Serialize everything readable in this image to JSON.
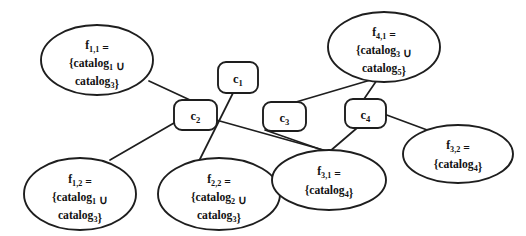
{
  "diagram": {
    "background_color": "#ffffff",
    "stroke_color": "#1e1e1e",
    "union_symbol": "∪",
    "fragments": [
      {
        "id": "f-1-1",
        "name": "f",
        "sub": "1,1",
        "line1": "f",
        "line1_sub": "1,1",
        "line1_eq": " =",
        "line2_open": "{catalog",
        "line2_sub": "1",
        "line2_tail": " ∪",
        "line3_open": "catalog",
        "line3_sub": "3",
        "line3_tail": "}",
        "full_text": "f1,1 = {catalog1 ∪ catalog3}",
        "cx": 97,
        "cy": 60,
        "rx": 56,
        "ry": 35
      },
      {
        "id": "f-4-1",
        "name": "f",
        "sub": "4,1",
        "line1": "f",
        "line1_sub": "4,1",
        "line1_eq": " =",
        "line2_open": "{catalog",
        "line2_sub": "3",
        "line2_tail": " ∪",
        "line3_open": "catalog",
        "line3_sub": "5",
        "line3_tail": "}",
        "full_text": "f4,1 = {catalog3 ∪ catalog5}",
        "cx": 384,
        "cy": 47,
        "rx": 56,
        "ry": 35
      },
      {
        "id": "f-1-2",
        "name": "f",
        "sub": "1,2",
        "line1": "f",
        "line1_sub": "1,2",
        "line1_eq": " =",
        "line2_open": "{catalog",
        "line2_sub": "1",
        "line2_tail": " ∪",
        "line3_open": "catalog",
        "line3_sub": "3",
        "line3_tail": "}",
        "full_text": "f1,2 = {catalog1 ∪ catalog3}",
        "cx": 80,
        "cy": 194,
        "rx": 56,
        "ry": 36
      },
      {
        "id": "f-2-2",
        "name": "f",
        "sub": "2,2",
        "line1": "f",
        "line1_sub": "2,2",
        "line1_eq": " =",
        "line2_open": "{catalog",
        "line2_sub": "2",
        "line2_tail": " ∪",
        "line3_open": "catalog",
        "line3_sub": "3",
        "line3_tail": "}",
        "full_text": "f2,2 = {catalog2 ∪ catalog3}",
        "cx": 219,
        "cy": 194,
        "rx": 61,
        "ry": 36
      },
      {
        "id": "f-3-1",
        "name": "f",
        "sub": "3,1",
        "line1": "f",
        "line1_sub": "3,1",
        "line1_eq": " =",
        "line2_open": "{catalog",
        "line2_sub": "4",
        "line2_tail": "}",
        "line3_open": "",
        "line3_sub": "",
        "line3_tail": "",
        "full_text": "f3,1 = {catalog4}",
        "cx": 329,
        "cy": 180,
        "rx": 57,
        "ry": 30
      },
      {
        "id": "f-3-2",
        "name": "f",
        "sub": "3,2",
        "line1": "f",
        "line1_sub": "3,2",
        "line1_eq": " =",
        "line2_open": "{catalog",
        "line2_sub": "4",
        "line2_tail": "}",
        "line3_open": "",
        "line3_sub": "",
        "line3_tail": "",
        "full_text": "f3,2 = {catalog4}",
        "cx": 458,
        "cy": 154,
        "rx": 55,
        "ry": 29
      }
    ],
    "sites": [
      {
        "id": "c-1",
        "name": "c",
        "sub": "1",
        "full_text": "c1",
        "x": 218,
        "y": 62,
        "w": 40,
        "h": 31,
        "r": 8
      },
      {
        "id": "c-2",
        "name": "c",
        "sub": "2",
        "full_text": "c2",
        "x": 174,
        "y": 100,
        "w": 43,
        "h": 30,
        "r": 8
      },
      {
        "id": "c-3",
        "name": "c",
        "sub": "3",
        "full_text": "c3",
        "x": 263,
        "y": 102,
        "w": 43,
        "h": 29,
        "r": 8
      },
      {
        "id": "c-4",
        "name": "c",
        "sub": "4",
        "full_text": "c4",
        "x": 345,
        "y": 99,
        "w": 41,
        "h": 29,
        "r": 8
      }
    ],
    "edges": [
      {
        "id": "edge-f11-c2",
        "from": "f-1-1",
        "to": "c-2",
        "x1": 149,
        "y1": 81,
        "x2": 190,
        "y2": 100
      },
      {
        "id": "edge-c2-f12",
        "from": "c-2",
        "to": "f-1-2",
        "x1": 174,
        "y1": 123,
        "x2": 110,
        "y2": 160
      },
      {
        "id": "edge-c1-f22",
        "from": "c-1",
        "to": "f-2-2",
        "x1": 233,
        "y1": 93,
        "x2": 199,
        "y2": 161
      },
      {
        "id": "edge-c2-f31",
        "from": "c-2",
        "to": "f-3-1",
        "x1": 209,
        "y1": 118,
        "x2": 327,
        "y2": 151
      },
      {
        "id": "edge-c3-f31",
        "from": "c-3",
        "to": "f-3-1",
        "x1": 265,
        "y1": 130,
        "x2": 328,
        "y2": 152
      },
      {
        "id": "edge-c4-f31",
        "from": "c-4",
        "to": "f-3-1",
        "x1": 357,
        "y1": 128,
        "x2": 329,
        "y2": 152
      },
      {
        "id": "edge-c3-f41",
        "from": "c-3",
        "to": "f-4-1",
        "x1": 296,
        "y1": 102,
        "x2": 374,
        "y2": 79
      },
      {
        "id": "edge-c4-f41",
        "from": "c-4",
        "to": "f-4-1",
        "x1": 364,
        "y1": 99,
        "x2": 377,
        "y2": 80
      },
      {
        "id": "edge-c4-f32",
        "from": "c-4",
        "to": "f-3-2",
        "x1": 384,
        "y1": 114,
        "x2": 438,
        "y2": 134
      }
    ]
  }
}
